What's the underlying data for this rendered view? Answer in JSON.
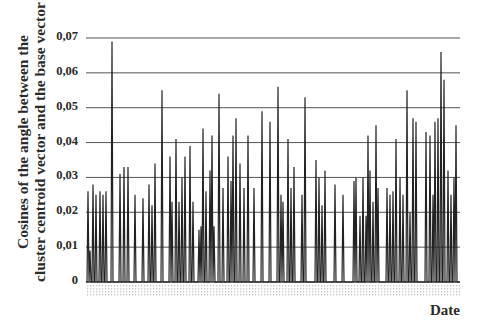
{
  "chart_data": {
    "type": "line",
    "title": "",
    "xlabel": "Date",
    "ylabel": "Cosines of the angle between the cluster centroid vector and the base vector",
    "ylabel_lines": [
      "Cosines of the angle between the",
      "cluster centroid vector and the base vector"
    ],
    "ylim": [
      0,
      0.07
    ],
    "yticks": [
      "0",
      "0,01",
      "0,02",
      "0,03",
      "0,04",
      "0,05",
      "0,06",
      "0,07"
    ],
    "grid": "horizontal",
    "legend": "none",
    "series": [
      {
        "name": "cosine",
        "color": "#222222",
        "x_px": [
          88,
          90,
          93,
          96,
          100,
          103,
          106,
          112,
          120,
          124,
          128,
          135,
          143,
          149,
          152,
          155,
          162,
          170,
          172,
          176,
          179,
          182,
          185,
          190,
          193,
          199,
          201,
          203,
          206,
          210,
          212,
          214,
          219,
          223,
          228,
          231,
          233,
          236,
          240,
          244,
          248,
          254,
          262,
          270,
          278,
          281,
          283,
          288,
          291,
          294,
          302,
          305,
          316,
          319,
          322,
          325,
          335,
          343,
          354,
          356,
          360,
          363,
          366,
          368,
          370,
          373,
          376,
          378,
          387,
          390,
          393,
          396,
          400,
          403,
          407,
          410,
          413,
          416,
          426,
          430,
          433,
          435,
          438,
          441,
          444,
          448,
          451,
          454,
          456
        ],
        "values": [
          0.026,
          0.009,
          0.028,
          0.025,
          0.026,
          0.025,
          0.026,
          0.069,
          0.031,
          0.033,
          0.033,
          0.025,
          0.024,
          0.028,
          0.022,
          0.034,
          0.055,
          0.036,
          0.023,
          0.041,
          0.023,
          0.03,
          0.036,
          0.039,
          0.023,
          0.015,
          0.016,
          0.044,
          0.026,
          0.032,
          0.042,
          0.016,
          0.054,
          0.027,
          0.036,
          0.029,
          0.042,
          0.047,
          0.034,
          0.027,
          0.042,
          0.027,
          0.049,
          0.046,
          0.056,
          0.025,
          0.023,
          0.041,
          0.027,
          0.033,
          0.025,
          0.053,
          0.035,
          0.03,
          0.022,
          0.032,
          0.028,
          0.025,
          0.029,
          0.03,
          0.019,
          0.03,
          0.019,
          0.042,
          0.032,
          0.023,
          0.045,
          0.027,
          0.027,
          0.025,
          0.026,
          0.041,
          0.03,
          0.025,
          0.055,
          0.02,
          0.047,
          0.046,
          0.043,
          0.042,
          0.025,
          0.046,
          0.047,
          0.066,
          0.058,
          0.032,
          0.025,
          0.03,
          0.045
        ]
      }
    ],
    "x_tick_labels": "illegible dense date labels"
  },
  "layout": {
    "plot_left": 86,
    "plot_right": 460,
    "y_zero_px": 282,
    "y_max_px": 38
  }
}
